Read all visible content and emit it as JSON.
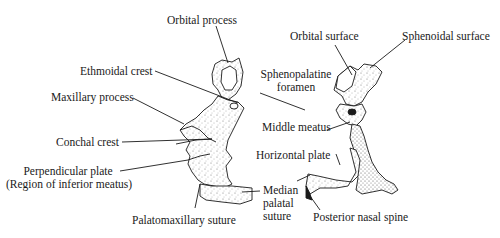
{
  "figure": {
    "colors": {
      "ink": "#1a1a1a",
      "background": "#ffffff",
      "stipple": "#555555"
    }
  },
  "left_view": {
    "labels": {
      "orbital_process": "Orbital process",
      "ethmoidal_crest": "Ethmoidal crest",
      "maxillary_process": "Maxillary process",
      "conchal_crest": "Conchal crest",
      "perpendicular_plate_line1": "Perpendicular plate",
      "perpendicular_plate_line2": "(Region of inferior meatus)",
      "palatomaxillary_suture": "Palatomaxillary suture",
      "median_palatal_suture_line1": "Median",
      "median_palatal_suture_line2": "palatal",
      "median_palatal_suture_line3": "suture"
    }
  },
  "right_view": {
    "labels": {
      "orbital_surface": "Orbital surface",
      "sphenoidal_surface": "Sphenoidal surface",
      "sphenopalatine_foramen_line1": "Sphenopalatine",
      "sphenopalatine_foramen_line2": "foramen",
      "middle_meatus": "Middle meatus",
      "horizontal_plate": "Horizontal plate",
      "posterior_nasal_spine": "Posterior nasal spine"
    }
  }
}
